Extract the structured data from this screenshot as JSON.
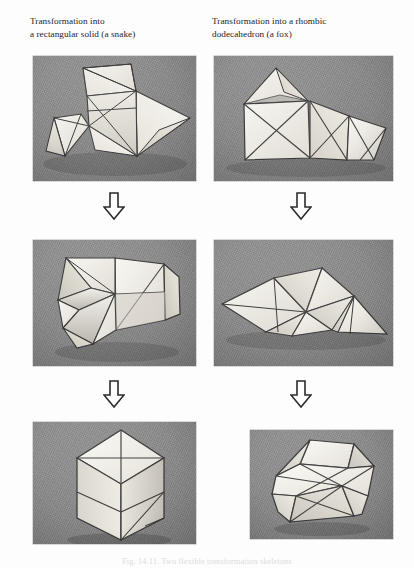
{
  "page": {
    "background_color": "#fdfdfd",
    "caption": "Fig. 14.11. Two flexible transformation skeletons"
  },
  "columns": [
    {
      "id": "left",
      "heading": "Transformation into\na rectangular solid (a snake)"
    },
    {
      "id": "right",
      "heading": "Transformation into a rhombic\ndodecahedron (a fox)"
    }
  ],
  "arrows": [
    {
      "name": "arrow-left-row1-to-row2",
      "glyph": "down-block-arrow"
    },
    {
      "name": "arrow-right-row1-to-row2",
      "glyph": "down-block-arrow"
    },
    {
      "name": "arrow-left-row2-to-row3",
      "glyph": "down-block-arrow"
    },
    {
      "name": "arrow-right-row2-to-row3",
      "glyph": "down-block-arrow"
    }
  ],
  "photos": [
    {
      "id": "left-stage-1",
      "column": "left",
      "stage": 1,
      "alt": "Flat paper skeleton of triangles spread out, the snake model unfolded",
      "background_color": "#8d8d8d",
      "model_color": "#eeece7"
    },
    {
      "id": "right-stage-1",
      "column": "right",
      "stage": 1,
      "alt": "Flat paper skeleton of triangles and squares, the fox model unfolded",
      "background_color": "#8d8d8d",
      "model_color": "#eeece7"
    },
    {
      "id": "left-stage-2",
      "column": "left",
      "stage": 2,
      "alt": "Partially folded skeleton forming a pinwheel and a half box",
      "background_color": "#8d8d8d",
      "model_color": "#eeece7"
    },
    {
      "id": "right-stage-2",
      "column": "right",
      "stage": 2,
      "alt": "Partially folded skeleton, low wide double pyramid shape",
      "background_color": "#8d8d8d",
      "model_color": "#eeece7"
    },
    {
      "id": "left-stage-3",
      "column": "left",
      "stage": 3,
      "alt": "Completed rectangular solid standing upright",
      "background_color": "#8d8d8d",
      "model_color": "#eeece7"
    },
    {
      "id": "right-stage-3",
      "column": "right",
      "stage": 3,
      "alt": "Completed rhombic dodecahedron",
      "background_color": "#8d8d8d",
      "model_color": "#eeece7"
    }
  ]
}
